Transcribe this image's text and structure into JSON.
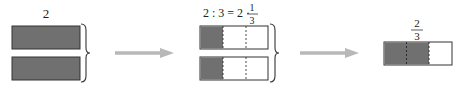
{
  "diagram": {
    "colors": {
      "shade": "#707070",
      "outline": "#333333",
      "arrow": "#b8b8b8",
      "background": "#ffffff"
    },
    "step1": {
      "label": "2",
      "bars": [
        {
          "name": "whole-1",
          "shaded_fraction": 1
        },
        {
          "name": "whole-2",
          "shaded_fraction": 1
        }
      ]
    },
    "step2": {
      "equation_left": "2 : 3 = 2 ·",
      "fraction_numerator": "1",
      "fraction_denominator": "3",
      "divisions": 3,
      "shaded_parts_per_bar": 1
    },
    "step3": {
      "fraction_numerator": "2",
      "fraction_denominator": "3",
      "divisions": 3,
      "shaded_parts": 2
    },
    "arrows": [
      {
        "from": "step1",
        "to": "step2"
      },
      {
        "from": "step2",
        "to": "step3"
      }
    ]
  }
}
